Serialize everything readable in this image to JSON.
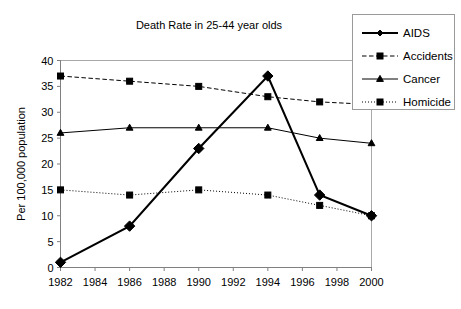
{
  "chart_data": {
    "type": "line",
    "title": "Death Rate in 25-44 year olds",
    "xlabel": "",
    "ylabel": "Per 100,000 population",
    "x": [
      1982,
      1986,
      1990,
      1994,
      1997,
      2000
    ],
    "xtick_labels": [
      "1982",
      "1984",
      "1986",
      "1988",
      "1990",
      "1992",
      "1994",
      "1996",
      "1998",
      "2000"
    ],
    "xtick_values": [
      1982,
      1984,
      1986,
      1988,
      1990,
      1992,
      1994,
      1996,
      1998,
      2000
    ],
    "ytick_labels": [
      "0",
      "5",
      "10",
      "15",
      "20",
      "25",
      "30",
      "35",
      "40"
    ],
    "ytick_values": [
      0,
      5,
      10,
      15,
      20,
      25,
      30,
      35,
      40
    ],
    "xlim": [
      1982,
      2000
    ],
    "ylim": [
      0,
      40
    ],
    "grid": false,
    "legend_position": "top-right",
    "series": [
      {
        "name": "AIDS",
        "marker": "diamond",
        "linestyle": "solid",
        "linewidth": "thick",
        "color": "#000000",
        "values": [
          1,
          8,
          23,
          37,
          14,
          10
        ]
      },
      {
        "name": "Accidents",
        "marker": "square",
        "linestyle": "dashed",
        "linewidth": "thin",
        "color": "#000000",
        "values": [
          37,
          36,
          35,
          33,
          32,
          31.5
        ]
      },
      {
        "name": "Cancer",
        "marker": "triangle",
        "linestyle": "solid",
        "linewidth": "thin",
        "color": "#000000",
        "values": [
          26,
          27,
          27,
          27,
          25,
          24
        ]
      },
      {
        "name": "Homicide",
        "marker": "square",
        "linestyle": "dotted",
        "linewidth": "thin",
        "color": "#000000",
        "values": [
          15,
          14,
          15,
          14,
          12,
          10
        ]
      }
    ]
  },
  "legend": {
    "entries": [
      {
        "label": "AIDS"
      },
      {
        "label": "Accidents"
      },
      {
        "label": "Cancer"
      },
      {
        "label": "Homicide"
      }
    ]
  }
}
